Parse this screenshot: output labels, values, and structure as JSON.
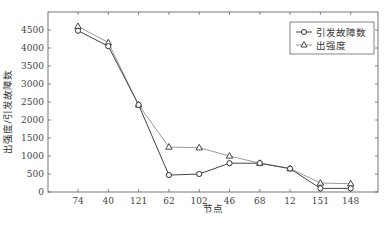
{
  "chart_data": {
    "type": "line",
    "title": "",
    "xlabel": "节点",
    "ylabel": "出强度/引发故障数",
    "categories": [
      "74",
      "40",
      "121",
      "62",
      "102",
      "46",
      "68",
      "12",
      "151",
      "148"
    ],
    "series": [
      {
        "name": "引发故障数",
        "marker": "circle",
        "values": [
          4480,
          4050,
          2420,
          470,
          500,
          800,
          800,
          650,
          100,
          100
        ]
      },
      {
        "name": "出强度",
        "marker": "triangle",
        "values": [
          4600,
          4150,
          2420,
          1250,
          1230,
          1000,
          800,
          650,
          250,
          230
        ]
      }
    ],
    "ylim": [
      0,
      5000
    ],
    "yticks": [
      0,
      500,
      1000,
      1500,
      2000,
      2500,
      3000,
      3500,
      4000,
      4500
    ],
    "grid": false,
    "legend_position": "upper right"
  },
  "colors": {
    "line_circle": "#444444",
    "line_triangle": "#9a9a9a",
    "axis": "#555555"
  }
}
